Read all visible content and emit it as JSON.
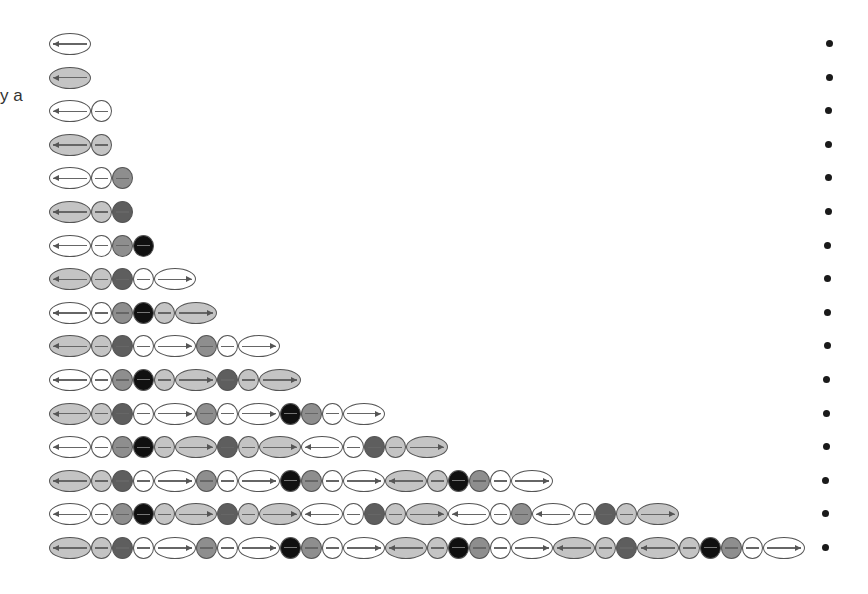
{
  "left_text": "y a",
  "colors": {
    "W": "#ffffff",
    "LG": "#c4c4c4",
    "MG": "#8e8e8e",
    "DG": "#5e5e5e",
    "BK": "#101010"
  },
  "legend_codes": {
    "shape": {
      "E": "ellipse",
      "c": "circle"
    },
    "direction": {
      "L": "left-arrow",
      "R": "right-arrow",
      "": "plain-line"
    }
  },
  "rows": [
    "W-E-L",
    "LG-E-L",
    "W-E-L W-c",
    "LG-E-L LG-c",
    "W-E-L W-c MG-c",
    "LG-E-L LG-c DG-c",
    "W-E-L W-c MG-c BK-c",
    "LG-E-L LG-c DG-c W-c W-E-R",
    "W-E-L W-c MG-c BK-c LG-c LG-E-R",
    "LG-E-L LG-c DG-c W-c W-E-R MG-c W-c W-E-R",
    "W-E-L W-c MG-c BK-c LG-c LG-E-R DG-c LG-c LG-E-R",
    "LG-E-L LG-c DG-c W-c W-E-R MG-c W-c W-E-R BK-c MG-c W-c W-E-R",
    "W-E-L W-c MG-c BK-c LG-c LG-E-R DG-c LG-c LG-E-R W-E-L W-c DG-c LG-c LG-E-R",
    "LG-E-L LG-c DG-c W-c W-E-R MG-c W-c W-E-R BK-c MG-c W-c W-E-R LG-E-L LG-c BK-c MG-c W-c W-E-R",
    "W-E-L W-c MG-c BK-c LG-c LG-E-R DG-c LG-c LG-E-R W-E-L W-c DG-c LG-c LG-E-R W-E-L W-c MG-c W-E-L W-c DG-c LG-c LG-E-R",
    "LG-E-L LG-c DG-c W-c W-E-R MG-c W-c W-E-R BK-c MG-c W-c W-E-R LG-E-L LG-c BK-c MG-c W-c W-E-R LG-E-L LG-c DG-c LG-E-L LG-c BK-c MG-c W-c W-E-R"
  ],
  "layout": {
    "row_top_first": 33,
    "row_pitch": 33.6,
    "dot_count": 16
  }
}
